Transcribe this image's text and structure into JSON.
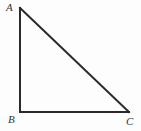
{
  "figure": {
    "type": "right-triangle-diagram",
    "background_color": "#fdfdfd",
    "stroke_color": "#2a2a2a",
    "stroke_width": 2,
    "label_color": "#333333",
    "canvas": {
      "width": 141,
      "height": 131
    },
    "vertices": [
      {
        "id": "A",
        "label": "A",
        "x": 20,
        "y": 8,
        "label_x": 6,
        "label_y": 2
      },
      {
        "id": "B",
        "label": "B",
        "x": 20,
        "y": 112,
        "label_x": 8,
        "label_y": 114
      },
      {
        "id": "C",
        "label": "C",
        "x": 129,
        "y": 112,
        "label_x": 126,
        "label_y": 116
      }
    ],
    "edges": [
      {
        "id": "AB",
        "from": "A",
        "to": "B",
        "x1": 20,
        "y1": 8,
        "x2": 20,
        "y2": 112
      },
      {
        "id": "BC",
        "from": "B",
        "to": "C",
        "x1": 20,
        "y1": 112,
        "x2": 129,
        "y2": 112
      },
      {
        "id": "CA",
        "from": "C",
        "to": "A",
        "x1": 129,
        "y1": 112,
        "x2": 20,
        "y2": 8
      }
    ],
    "right_angle_at": "B"
  }
}
